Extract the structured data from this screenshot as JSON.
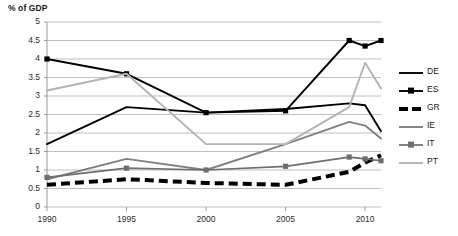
{
  "chart_data": {
    "type": "line",
    "title": "% of GDP",
    "xlabel": "",
    "ylabel": "% of GDP",
    "grid": true,
    "legend_position": "right",
    "x": [
      1990,
      1995,
      2000,
      2005,
      2009,
      2010,
      2011
    ],
    "x_tick_labels": [
      "1990",
      "1995",
      "2000",
      "2005",
      "2010"
    ],
    "x_tick_values": [
      1990,
      1995,
      2000,
      2005,
      2010
    ],
    "xlim": [
      1990,
      2011
    ],
    "y_tick_labels": [
      "0",
      "0.5",
      "1",
      "1.5",
      "2",
      "2.5",
      "3",
      "3.5",
      "4",
      "4.5",
      "5"
    ],
    "y_tick_values": [
      0,
      0.5,
      1,
      1.5,
      2,
      2.5,
      3,
      3.5,
      4,
      4.5,
      5
    ],
    "ylim": [
      0,
      5
    ],
    "series": [
      {
        "name": "DE",
        "color": "#000000",
        "style": "solid",
        "marker": "none",
        "width": 1.9,
        "values": [
          1.7,
          2.7,
          2.55,
          2.65,
          2.8,
          2.75,
          2.05
        ]
      },
      {
        "name": "ES",
        "color": "#000000",
        "style": "solid",
        "marker": "square",
        "width": 1.9,
        "values": [
          4.0,
          3.6,
          2.55,
          2.6,
          4.5,
          4.35,
          4.5
        ]
      },
      {
        "name": "GR",
        "color": "#000000",
        "style": "dashed",
        "marker": "none",
        "width": 4.0,
        "values": [
          0.6,
          0.75,
          0.65,
          0.6,
          0.95,
          1.2,
          1.4
        ]
      },
      {
        "name": "IE",
        "color": "#808080",
        "style": "solid",
        "marker": "none",
        "width": 1.9,
        "values": [
          0.75,
          1.3,
          1.0,
          1.7,
          2.3,
          2.2,
          1.85
        ]
      },
      {
        "name": "IT",
        "color": "#6e6e6e",
        "style": "solid",
        "marker": "square",
        "width": 1.7,
        "values": [
          0.8,
          1.05,
          1.0,
          1.1,
          1.35,
          1.3,
          1.25
        ]
      },
      {
        "name": "PT",
        "color": "#b3b3b3",
        "style": "solid",
        "marker": "none",
        "width": 1.9,
        "values": [
          3.15,
          3.6,
          1.7,
          1.7,
          2.7,
          3.9,
          3.2
        ]
      }
    ]
  },
  "legend": {
    "items": [
      {
        "label": "DE"
      },
      {
        "label": "ES"
      },
      {
        "label": "GR"
      },
      {
        "label": "IE"
      },
      {
        "label": "IT"
      },
      {
        "label": "PT"
      }
    ]
  },
  "colors": {
    "gridline": "#bfbfbf",
    "axis": "#9a9a9a",
    "background": "#ffffff"
  }
}
